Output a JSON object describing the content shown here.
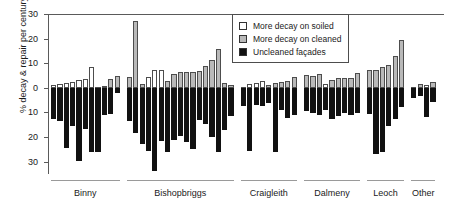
{
  "chart_data": {
    "type": "bar",
    "title": "",
    "subtitle": "",
    "xlabel": "",
    "ylabel": "% decay & repair per century",
    "ylim": [
      -35,
      30
    ],
    "yticks": [
      30,
      20,
      10,
      0,
      10,
      20,
      30
    ],
    "ytick_values": [
      30,
      20,
      10,
      0,
      -10,
      -20,
      -30
    ],
    "grid": false,
    "legend_position": "top-right",
    "note": "Paired bars: positive bar above zero is the cleaned-vs-soiled difference (white = more decay on soiled, grey = more decay on cleaned); black bar below zero is the uncleaned facade decay rate.",
    "legend": [
      {
        "label": "More decay on soiled",
        "color": "#ffffff",
        "key": "soiled"
      },
      {
        "label": "More decay on cleaned",
        "color": "#b9b9b9",
        "key": "cleaned"
      },
      {
        "label": "Uncleaned façades",
        "color": "#111111",
        "key": "uncleaned"
      }
    ],
    "groups": [
      {
        "name": "Binny",
        "count": 11
      },
      {
        "name": "Bishopbriggs",
        "count": 17
      },
      {
        "name": "Craigleith",
        "count": 9
      },
      {
        "name": "Dalmeny",
        "count": 9
      },
      {
        "name": "Leoch",
        "count": 6
      },
      {
        "name": "Other",
        "count": 4
      }
    ],
    "series": [
      {
        "name": "Difference (cleaned vs soiled)",
        "values": [
          1.0,
          1.6,
          2.0,
          2.4,
          3.2,
          3.6,
          8.6,
          0.0,
          0.8,
          3.4,
          5.0,
          4.4,
          27.0,
          1.6,
          4.4,
          7.2,
          7.4,
          2.6,
          5.6,
          6.6,
          6.6,
          6.6,
          7.0,
          9.0,
          11.2,
          15.6,
          1.8,
          1.0,
          0.0,
          1.4,
          2.0,
          2.8,
          1.2,
          1.8,
          2.2,
          2.6,
          4.6,
          5.4,
          4.8,
          5.8,
          1.6,
          3.2,
          3.8,
          4.2,
          4.0,
          6.0,
          7.2,
          7.2,
          8.6,
          9.4,
          13.0,
          19.6,
          0.2,
          1.6,
          1.0,
          2.2,
          0.6
        ],
        "types": [
          "soiled",
          "soiled",
          "soiled",
          "soiled",
          "soiled",
          "soiled",
          "soiled",
          "cleaned",
          "cleaned",
          "cleaned",
          "cleaned",
          "cleaned",
          "cleaned",
          "cleaned",
          "soiled",
          "soiled",
          "soiled",
          "cleaned",
          "cleaned",
          "cleaned",
          "cleaned",
          "cleaned",
          "cleaned",
          "cleaned",
          "cleaned",
          "cleaned",
          "cleaned",
          "cleaned",
          "soiled",
          "soiled",
          "soiled",
          "soiled",
          "cleaned",
          "cleaned",
          "cleaned",
          "cleaned",
          "cleaned",
          "cleaned",
          "cleaned",
          "cleaned",
          "soiled",
          "cleaned",
          "cleaned",
          "cleaned",
          "cleaned",
          "cleaned",
          "cleaned",
          "cleaned",
          "cleaned",
          "cleaned",
          "cleaned",
          "cleaned",
          "cleaned",
          "cleaned",
          "soiled",
          "cleaned",
          "soiled"
        ]
      },
      {
        "name": "Uncleaned façades",
        "values": [
          -12.6,
          -13.4,
          -24.6,
          -15.4,
          -29.6,
          -16.8,
          -26.0,
          -26.0,
          -11.2,
          -10.6,
          -2.0,
          -13.4,
          -18.4,
          -23.0,
          -25.8,
          -33.6,
          -21.4,
          -26.0,
          -21.2,
          -19.4,
          -22.0,
          -24.8,
          -13.2,
          -14.6,
          -20.0,
          -26.0,
          -17.0,
          -11.6,
          -7.4,
          -25.8,
          -7.0,
          -7.4,
          -6.2,
          -26.2,
          -9.2,
          -12.4,
          -11.2,
          -9.6,
          -10.4,
          -11.0,
          -9.0,
          -12.8,
          -11.6,
          -10.4,
          -11.0,
          -10.4,
          -10.8,
          -27.0,
          -26.0,
          -15.4,
          -12.8,
          -7.6,
          -4.0,
          -3.4,
          -11.8,
          -5.6,
          -3.0
        ]
      }
    ]
  }
}
